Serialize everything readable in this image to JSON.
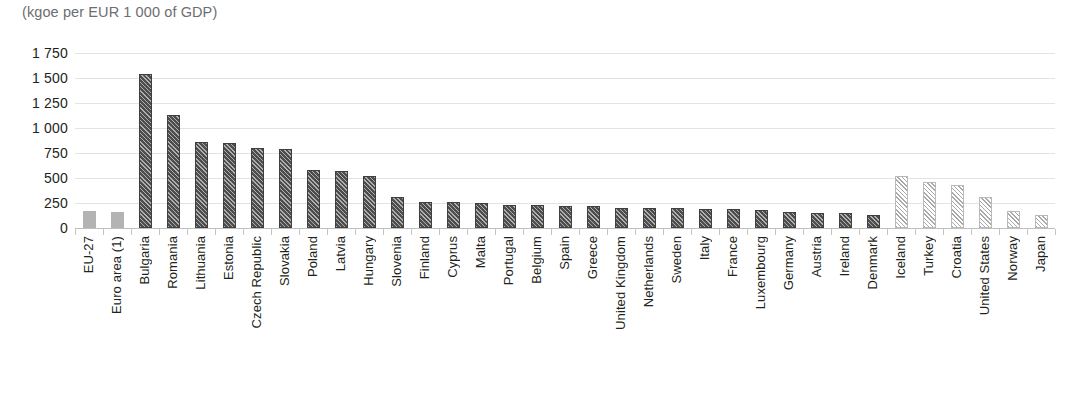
{
  "chart_data": {
    "type": "bar",
    "title": "",
    "subtitle": "(kgoe per EUR 1 000 of GDP)",
    "xlabel": "",
    "ylabel": "",
    "ylim": [
      0,
      1750
    ],
    "grid": true,
    "legend": "none",
    "ytick_labels": [
      "1 750",
      "1 500",
      "1 250",
      "1 000",
      "750",
      "500",
      "250",
      "0"
    ],
    "ytick_values": [
      1750,
      1500,
      1250,
      1000,
      750,
      500,
      250,
      0
    ],
    "categories": [
      "EU-27",
      "Euro area (1)",
      "Bulgaria",
      "Romania",
      "Lithuania",
      "Estonia",
      "Czech Republic",
      "Slovakia",
      "Poland",
      "Latvia",
      "Hungary",
      "Slovenia",
      "Finland",
      "Cyprus",
      "Malta",
      "Portugal",
      "Belgium",
      "Spain",
      "Greece",
      "United Kingdom",
      "Netherlands",
      "Sweden",
      "Italy",
      "France",
      "Luxembourg",
      "Germany",
      "Austria",
      "Ireland",
      "Denmark",
      "Iceland",
      "Turkey",
      "Croatia",
      "United States",
      "Norway",
      "Japan"
    ],
    "values": [
      168,
      163,
      1545,
      1130,
      860,
      850,
      805,
      790,
      580,
      570,
      525,
      310,
      265,
      260,
      255,
      235,
      230,
      225,
      220,
      205,
      200,
      200,
      195,
      190,
      185,
      160,
      155,
      150,
      130,
      525,
      465,
      430,
      310,
      170,
      135
    ],
    "styles": [
      "agg",
      "agg",
      "dark",
      "dark",
      "dark",
      "dark",
      "dark",
      "dark",
      "dark",
      "dark",
      "dark",
      "dark",
      "dark",
      "dark",
      "dark",
      "dark",
      "dark",
      "dark",
      "dark",
      "dark",
      "dark",
      "dark",
      "dark",
      "dark",
      "dark",
      "dark",
      "dark",
      "dark",
      "dark",
      "light",
      "light",
      "light",
      "light",
      "light",
      "light"
    ],
    "colors": {
      "aggregate_bar": "#b3b3b3",
      "member_state_bar": "#4d4d4d",
      "non_eu_bar": "#a8a8a8",
      "gridline": "#e3e3e3",
      "axis": "#bfbfbf",
      "text": "#231f20",
      "subtitle_text": "#6d6e71"
    }
  }
}
